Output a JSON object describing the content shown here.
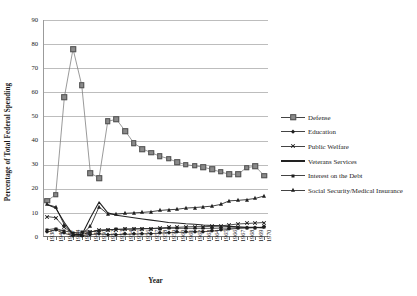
{
  "chart_data": {
    "type": "line",
    "title": "",
    "xlabel": "Year",
    "ylabel": "Percentage of Total Federal Spending",
    "ylim": [
      0,
      90
    ],
    "ytick_step": 10,
    "yticks": [
      "0",
      "10",
      "20",
      "30",
      "40",
      "50",
      "60",
      "70",
      "80",
      "90"
    ],
    "grid": true,
    "legend_position": "right",
    "categories": [
      "1938",
      "1940",
      "1942",
      "1944",
      "1946",
      "1948",
      "1950",
      "1952",
      "1953",
      "1954",
      "1955",
      "1956",
      "1957",
      "1958",
      "1959",
      "1960",
      "1961",
      "1962",
      "1963",
      "1964",
      "1965",
      "1966",
      "1967",
      "1968",
      "1969",
      "1970"
    ],
    "series": [
      {
        "name": "Defense",
        "marker": "square",
        "color": "#808080",
        "values": [
          15.0,
          17.5,
          58.0,
          78.0,
          63.0,
          26.5,
          24.5,
          48.0,
          48.8,
          44.0,
          39.0,
          36.5,
          35.0,
          33.5,
          32.5,
          31.0,
          30.0,
          29.5,
          29.0,
          28.0,
          27.0,
          26.0,
          26.0,
          28.8,
          29.3,
          25.5
        ]
      },
      {
        "name": "Education",
        "marker": "diamond",
        "color": "#222222",
        "values": [
          2.0,
          3.0,
          1.5,
          0.6,
          0.5,
          1.0,
          1.3,
          1.0,
          1.0,
          1.1,
          1.2,
          1.3,
          1.4,
          1.6,
          1.8,
          1.9,
          2.0,
          2.1,
          2.2,
          2.4,
          2.8,
          3.2,
          3.6,
          3.8,
          3.9,
          4.1
        ]
      },
      {
        "name": "Public Welfare",
        "marker": "x",
        "color": "#222222",
        "values": [
          8.5,
          8.0,
          4.0,
          1.2,
          1.0,
          2.0,
          3.0,
          3.0,
          3.1,
          3.2,
          3.3,
          3.4,
          3.5,
          3.8,
          4.0,
          4.0,
          4.2,
          4.3,
          4.3,
          4.4,
          4.6,
          5.0,
          5.4,
          5.6,
          5.8,
          6.0
        ]
      },
      {
        "name": "Veterans Services",
        "marker": "none",
        "color": "#222222",
        "values": [
          13.5,
          12.0,
          6.0,
          1.0,
          0.8,
          8.0,
          14.5,
          10.0,
          9.0,
          8.5,
          8.0,
          7.5,
          7.0,
          6.5,
          6.0,
          5.8,
          5.5,
          5.3,
          5.0,
          4.8,
          4.6,
          4.4,
          4.2,
          4.0,
          4.0,
          3.8
        ]
      },
      {
        "name": "Interest on the Debt",
        "marker": "small-square",
        "color": "#222222",
        "values": [
          3.0,
          3.5,
          2.5,
          1.8,
          2.0,
          2.2,
          2.5,
          3.0,
          3.2,
          3.3,
          3.4,
          3.5,
          3.5,
          3.5,
          3.6,
          3.6,
          3.6,
          3.6,
          3.6,
          3.6,
          3.7,
          3.7,
          3.8,
          3.8,
          3.9,
          4.0
        ]
      },
      {
        "name": "Social Security/Medical Insurance",
        "marker": "triangle",
        "color": "#111111",
        "values": [
          13.5,
          12.5,
          5.0,
          1.2,
          1.0,
          4.5,
          12.5,
          9.5,
          9.5,
          9.8,
          10.0,
          10.2,
          10.5,
          11.0,
          11.3,
          11.5,
          12.0,
          12.2,
          12.5,
          12.8,
          13.5,
          15.0,
          15.2,
          15.5,
          16.0,
          17.0
        ]
      }
    ]
  },
  "legend": {
    "items": [
      {
        "label": "Defense"
      },
      {
        "label": "Education"
      },
      {
        "label": "Public Welfare"
      },
      {
        "label": "Veterans Services"
      },
      {
        "label": "Interest on the Debt"
      },
      {
        "label": "Social Security/Medical Insurance"
      }
    ]
  }
}
